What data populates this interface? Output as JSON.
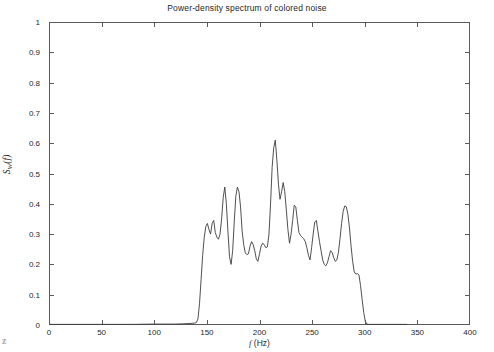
{
  "chart_data": {
    "type": "line",
    "title": "Power-density spectrum of colored noise",
    "xlabel": "f (Hz)",
    "xlabel_italic": "f",
    "xlabel_rest": " (Hz)",
    "ylabel": "S_W(f)",
    "ylabel_main": "S",
    "ylabel_sub": "W",
    "ylabel_arg": "(f)",
    "xlim": [
      0,
      400
    ],
    "ylim": [
      0,
      1
    ],
    "xticks": [
      0,
      50,
      100,
      150,
      200,
      250,
      300,
      350,
      400
    ],
    "xtick_labels": [
      "0",
      "50",
      "100",
      "150",
      "200",
      "250",
      "300",
      "350",
      "400"
    ],
    "yticks": [
      0,
      0.1,
      0.2,
      0.3,
      0.4,
      0.5,
      0.6,
      0.7,
      0.8,
      0.9,
      1
    ],
    "ytick_labels": [
      "0",
      "0.1",
      "0.2",
      "0.3",
      "0.4",
      "0.5",
      "0.6",
      "0.7",
      "0.8",
      "0.9",
      "1"
    ],
    "grid": false,
    "legend": null,
    "line_color": "#3c3c3c",
    "line_width": 0.9,
    "background_color": "#ffffff",
    "axis_color": "#5a5a5a",
    "x": [
      0,
      20,
      40,
      60,
      80,
      100,
      110,
      120,
      128,
      134,
      138,
      140,
      141.5,
      143,
      144.5,
      146,
      147.5,
      149,
      150.5,
      152,
      153.5,
      155,
      156.5,
      158,
      159.5,
      161,
      162.5,
      164,
      165.5,
      167,
      168.5,
      170,
      171.5,
      173,
      174.5,
      176,
      177.5,
      179,
      180.5,
      182,
      183.5,
      185,
      186.5,
      188,
      189.5,
      191,
      192.5,
      194,
      195.5,
      197,
      198.5,
      200,
      201.5,
      203,
      204.5,
      206,
      207.5,
      209,
      210.5,
      212,
      213.5,
      215,
      216.5,
      218,
      219.5,
      221,
      222.5,
      224,
      225.5,
      227,
      228.5,
      230,
      231.5,
      233,
      234.5,
      236,
      237.5,
      239,
      240.5,
      242,
      243.5,
      245,
      246.5,
      248,
      249.5,
      251,
      252.5,
      254,
      255.5,
      257,
      258.5,
      260,
      261.5,
      263,
      264.5,
      266,
      267.5,
      269,
      270.5,
      272,
      273.5,
      275,
      276.5,
      278,
      279.5,
      281,
      282.5,
      284,
      285.5,
      287,
      288.5,
      290,
      291.5,
      293,
      294.5,
      296,
      297.5,
      299,
      300.5,
      302,
      303.5,
      305,
      306.5,
      308,
      312,
      320,
      340,
      360,
      380,
      400
    ],
    "y": [
      0.002,
      0.002,
      0.002,
      0.002,
      0.002,
      0.003,
      0.003,
      0.003,
      0.004,
      0.005,
      0.006,
      0.008,
      0.02,
      0.07,
      0.15,
      0.23,
      0.29,
      0.325,
      0.335,
      0.315,
      0.3,
      0.335,
      0.345,
      0.305,
      0.29,
      0.283,
      0.3,
      0.35,
      0.42,
      0.455,
      0.4,
      0.31,
      0.225,
      0.2,
      0.245,
      0.34,
      0.425,
      0.455,
      0.44,
      0.39,
      0.31,
      0.265,
      0.238,
      0.232,
      0.235,
      0.26,
      0.275,
      0.265,
      0.245,
      0.218,
      0.21,
      0.235,
      0.26,
      0.27,
      0.265,
      0.255,
      0.258,
      0.3,
      0.4,
      0.52,
      0.585,
      0.61,
      0.545,
      0.465,
      0.415,
      0.44,
      0.47,
      0.44,
      0.38,
      0.315,
      0.27,
      0.3,
      0.345,
      0.395,
      0.39,
      0.345,
      0.305,
      0.295,
      0.29,
      0.285,
      0.275,
      0.255,
      0.23,
      0.215,
      0.255,
      0.3,
      0.34,
      0.345,
      0.31,
      0.275,
      0.245,
      0.215,
      0.2,
      0.195,
      0.205,
      0.225,
      0.245,
      0.24,
      0.222,
      0.21,
      0.215,
      0.24,
      0.285,
      0.335,
      0.375,
      0.393,
      0.39,
      0.365,
      0.32,
      0.26,
      0.21,
      0.175,
      0.168,
      0.17,
      0.165,
      0.13,
      0.085,
      0.042,
      0.012,
      0.003,
      0.002,
      0.002,
      0.002,
      0.002,
      0.002,
      0.002,
      0.002
    ]
  },
  "artifact": {
    "scan_mark": "z"
  }
}
